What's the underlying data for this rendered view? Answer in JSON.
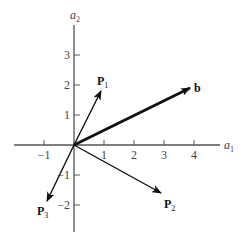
{
  "diagram": {
    "axes": {
      "x_label": "a",
      "x_label_sub": "1",
      "y_label": "a",
      "y_label_sub": "2",
      "x_ticks": [
        {
          "value": -1,
          "label": "−1"
        },
        {
          "value": 1,
          "label": "1"
        },
        {
          "value": 2,
          "label": "2"
        },
        {
          "value": 3,
          "label": "3"
        },
        {
          "value": 4,
          "label": "4"
        }
      ],
      "y_ticks": [
        {
          "value": 3,
          "label": "3"
        },
        {
          "value": 2,
          "label": "2"
        },
        {
          "value": 1,
          "label": "1"
        },
        {
          "value": -1,
          "label": "−1"
        },
        {
          "value": -2,
          "label": "−2"
        }
      ]
    },
    "vectors": [
      {
        "name": "P",
        "sub": "1",
        "tip": [
          0.9,
          1.8
        ],
        "bold_line": false
      },
      {
        "name": "b",
        "sub": "",
        "tip": [
          3.85,
          1.9
        ],
        "bold_line": true
      },
      {
        "name": "P",
        "sub": "2",
        "tip": [
          2.9,
          -1.6
        ],
        "bold_line": false
      },
      {
        "name": "P",
        "sub": "3",
        "tip": [
          -0.9,
          -1.85
        ],
        "bold_line": false
      }
    ],
    "colors": {
      "axis": "#555555",
      "vector": "#111111"
    }
  }
}
